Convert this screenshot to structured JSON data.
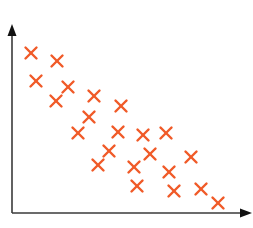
{
  "chart_data": {
    "type": "scatter",
    "title": "",
    "xlabel": "",
    "ylabel": "",
    "grid": false,
    "legend": null,
    "marker": "x",
    "marker_color": "#f05a28",
    "axis_color": "#3a3a3a",
    "xlim": [
      0,
      240
    ],
    "ylim": [
      0,
      190
    ],
    "series": [
      {
        "name": "points",
        "points": [
          {
            "x": 19,
            "y": 160
          },
          {
            "x": 45,
            "y": 152
          },
          {
            "x": 24,
            "y": 132
          },
          {
            "x": 56,
            "y": 126
          },
          {
            "x": 44,
            "y": 112
          },
          {
            "x": 82,
            "y": 117
          },
          {
            "x": 77,
            "y": 96
          },
          {
            "x": 109,
            "y": 107
          },
          {
            "x": 66,
            "y": 80
          },
          {
            "x": 106,
            "y": 81
          },
          {
            "x": 131,
            "y": 78
          },
          {
            "x": 154,
            "y": 80
          },
          {
            "x": 97,
            "y": 62
          },
          {
            "x": 138,
            "y": 59
          },
          {
            "x": 86,
            "y": 48
          },
          {
            "x": 122,
            "y": 46
          },
          {
            "x": 179,
            "y": 56
          },
          {
            "x": 157,
            "y": 41
          },
          {
            "x": 125,
            "y": 27
          },
          {
            "x": 162,
            "y": 22
          },
          {
            "x": 189,
            "y": 24
          },
          {
            "x": 206,
            "y": 10
          }
        ]
      }
    ],
    "trend": "negative correlation"
  },
  "layout": {
    "origin_px": [
      12,
      213
    ],
    "x_axis_end_px": 252,
    "y_axis_end_px": 24,
    "marker_half_size": 5.5
  }
}
